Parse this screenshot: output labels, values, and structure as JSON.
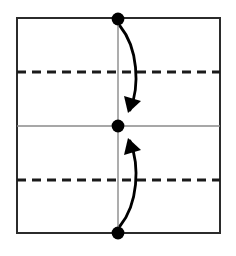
{
  "figure": {
    "kind": "origami-fold-diagram",
    "canvas": {
      "width": 236,
      "height": 256,
      "background": "#ffffff"
    },
    "colors": {
      "paper_border": "#2b2b2b",
      "crease_existing": "#8a8a8a",
      "crease_new_dashed": "#1a1a1a",
      "vertex_dot": "#000000",
      "arrow": "#000000",
      "paper_fill": "#ffffff"
    },
    "paper": {
      "label": "paper-sheet",
      "x": 17,
      "y": 18,
      "width": 203,
      "height": 215,
      "stroke_width": 2
    },
    "creases": [
      {
        "name": "vertical-center-crease",
        "style": "solid-thin",
        "orientation": "vertical",
        "x": 118,
        "y1": 18,
        "y2": 233,
        "stroke_width": 1.4
      },
      {
        "name": "horizontal-center-crease",
        "style": "solid-thin",
        "orientation": "horizontal",
        "y": 126,
        "x1": 17,
        "x2": 220,
        "stroke_width": 1.4
      },
      {
        "name": "upper-quarter-fold-line",
        "style": "dashed-bold",
        "orientation": "horizontal",
        "y": 72,
        "x1": 17,
        "x2": 220,
        "stroke_width": 3.2,
        "dash": "9 6"
      },
      {
        "name": "lower-quarter-fold-line",
        "style": "dashed-bold",
        "orientation": "horizontal",
        "y": 180,
        "x1": 17,
        "x2": 220,
        "stroke_width": 3.2,
        "dash": "9 6"
      }
    ],
    "vertices": [
      {
        "name": "top-edge-midpoint-dot",
        "cx": 118,
        "cy": 19,
        "r": 6.4
      },
      {
        "name": "center-dot",
        "cx": 118,
        "cy": 126,
        "r": 6.4
      },
      {
        "name": "bottom-edge-midpoint-dot",
        "cx": 118,
        "cy": 233,
        "r": 6.4
      }
    ],
    "arrows": [
      {
        "name": "top-fold-arrow",
        "direction": "downward",
        "meaning": "fold top edge down to center",
        "path": "M 120 26 C 138 48 140 86 130 110",
        "head_tip": {
          "x": 128,
          "y": 113
        },
        "head_points": "128,113 124,96 141,101",
        "stroke_width": 2.8
      },
      {
        "name": "bottom-fold-arrow",
        "direction": "upward",
        "meaning": "fold bottom edge up to center",
        "path": "M 120 226 C 138 204 140 166 130 141",
        "head_tip": {
          "x": 128,
          "y": 138
        },
        "head_points": "128,138 124,155 141,150",
        "stroke_width": 2.8
      }
    ]
  }
}
